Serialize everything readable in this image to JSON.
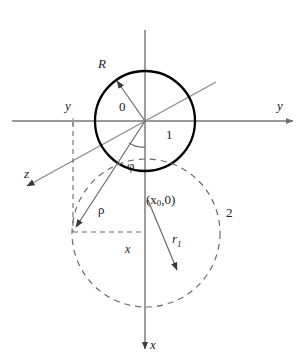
{
  "figure": {
    "type": "geometry-diagram",
    "colors": {
      "axis": "#8c8c8c",
      "solid_circle": "#000000",
      "dashed_circle": "#6b6b6b",
      "vector": "#555555",
      "text": "#1a1a1a",
      "background": "#ffffff"
    }
  },
  "labels": {
    "radius_R": "R",
    "origin": "0",
    "axis_y_right": "y",
    "axis_y_left": "y",
    "axis_z": "z",
    "axis_x": "x",
    "region_1": "1",
    "region_2": "2",
    "angle_phi": "φ",
    "radius_rho": "ρ",
    "coordinate_x": "x",
    "center_point": "(x",
    "center_point_sub": "0",
    "center_point_tail": ",0)",
    "radius_r1": "r",
    "radius_r1_sub": "1"
  },
  "geometry": {
    "origin": {
      "x": 145,
      "y": 121
    },
    "solid_circle": {
      "cx": 145,
      "cy": 121,
      "r": 50
    },
    "dashed_circle": {
      "cx": 146,
      "cy": 233,
      "r": 74
    },
    "horizontal_axis": {
      "x1": 12,
      "y1": 121,
      "x2": 296,
      "y2": 121
    },
    "vertical_axis": {
      "x1": 145,
      "y1": 30,
      "x2": 145,
      "y2": 352
    },
    "z_axis": {
      "x1": 216,
      "y1": 82,
      "x2": 24,
      "y2": 188
    },
    "vector_R": {
      "x1": 145,
      "y1": 121,
      "x2": 114,
      "y2": 77
    },
    "vector_rho": {
      "x1": 145,
      "y1": 121,
      "x2": 72,
      "y2": 232
    },
    "vector_r1": {
      "x1": 148,
      "y1": 200,
      "x2": 181,
      "y2": 277
    },
    "phi_arc_radius": 26,
    "dashed_vertical": {
      "x": 73,
      "y1": 122,
      "y2": 232
    },
    "dashed_horizontal": {
      "x1": 73,
      "x2": 145,
      "y": 232
    }
  }
}
